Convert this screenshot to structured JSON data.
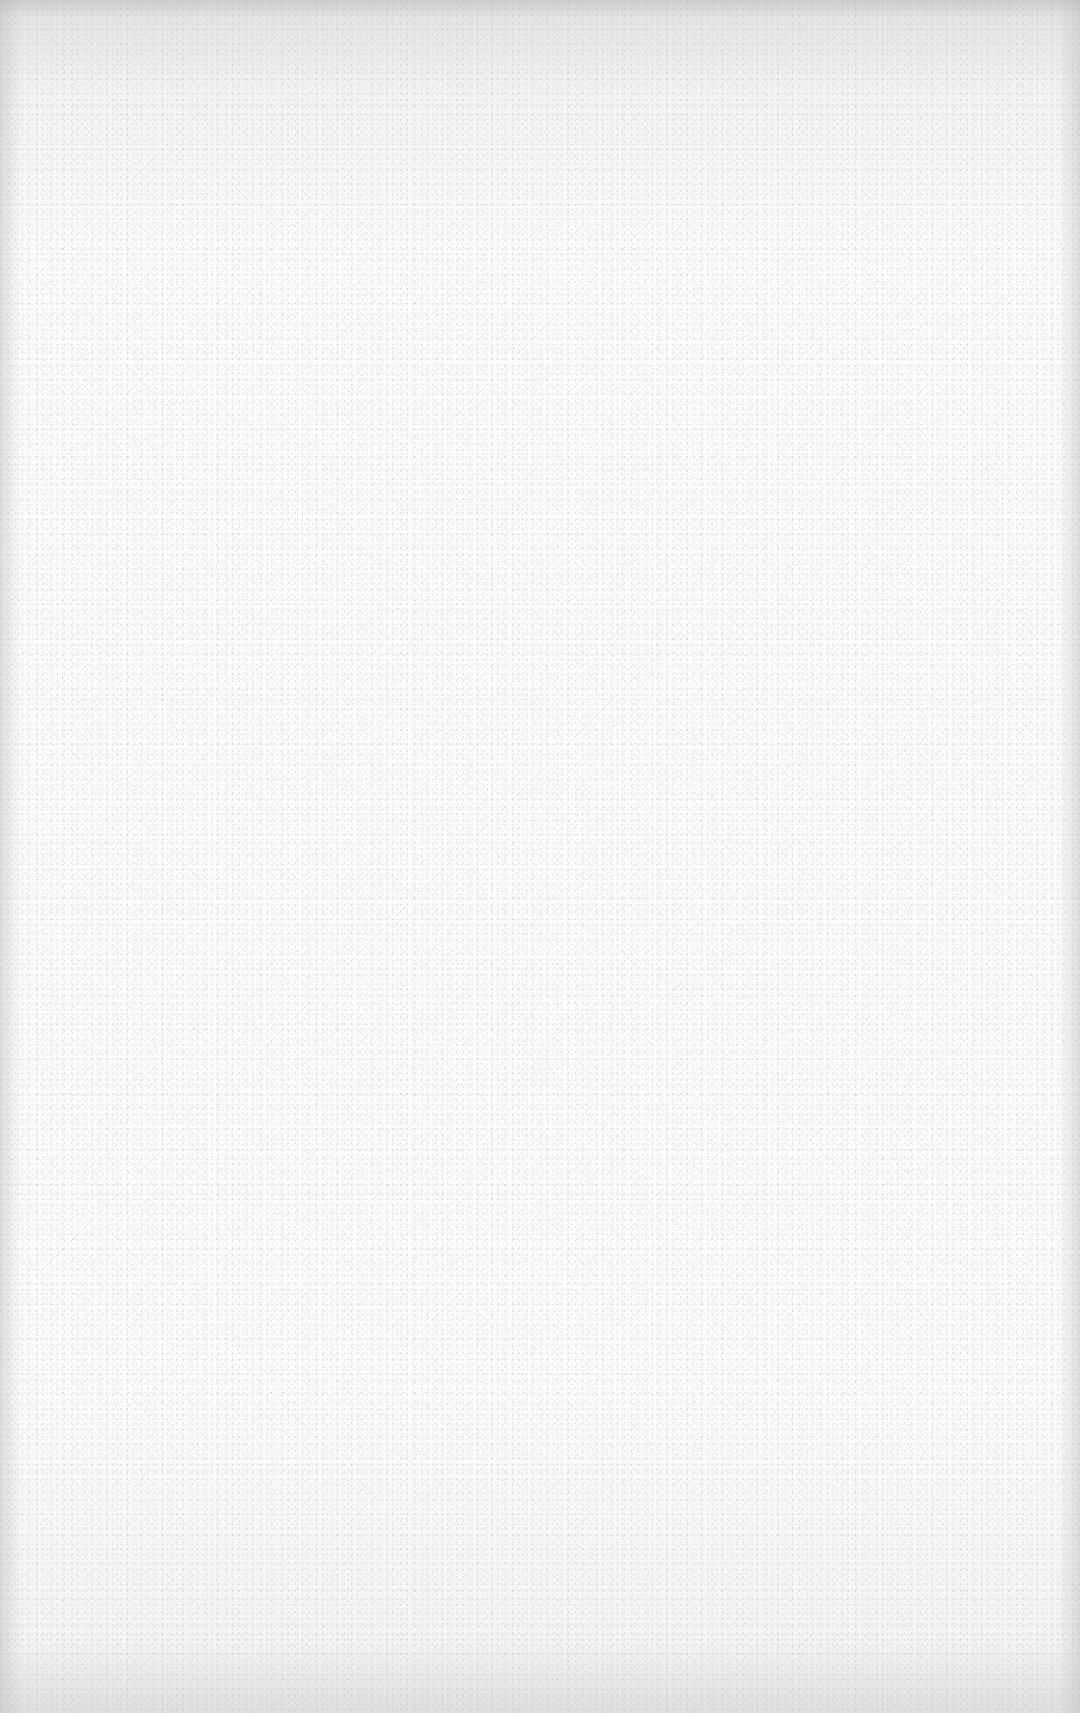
{
  "page": {
    "content": "",
    "paper_color": "#fcfcfc",
    "edge_shade_color": "#b9b9b9",
    "speckle_color": "#787878"
  }
}
